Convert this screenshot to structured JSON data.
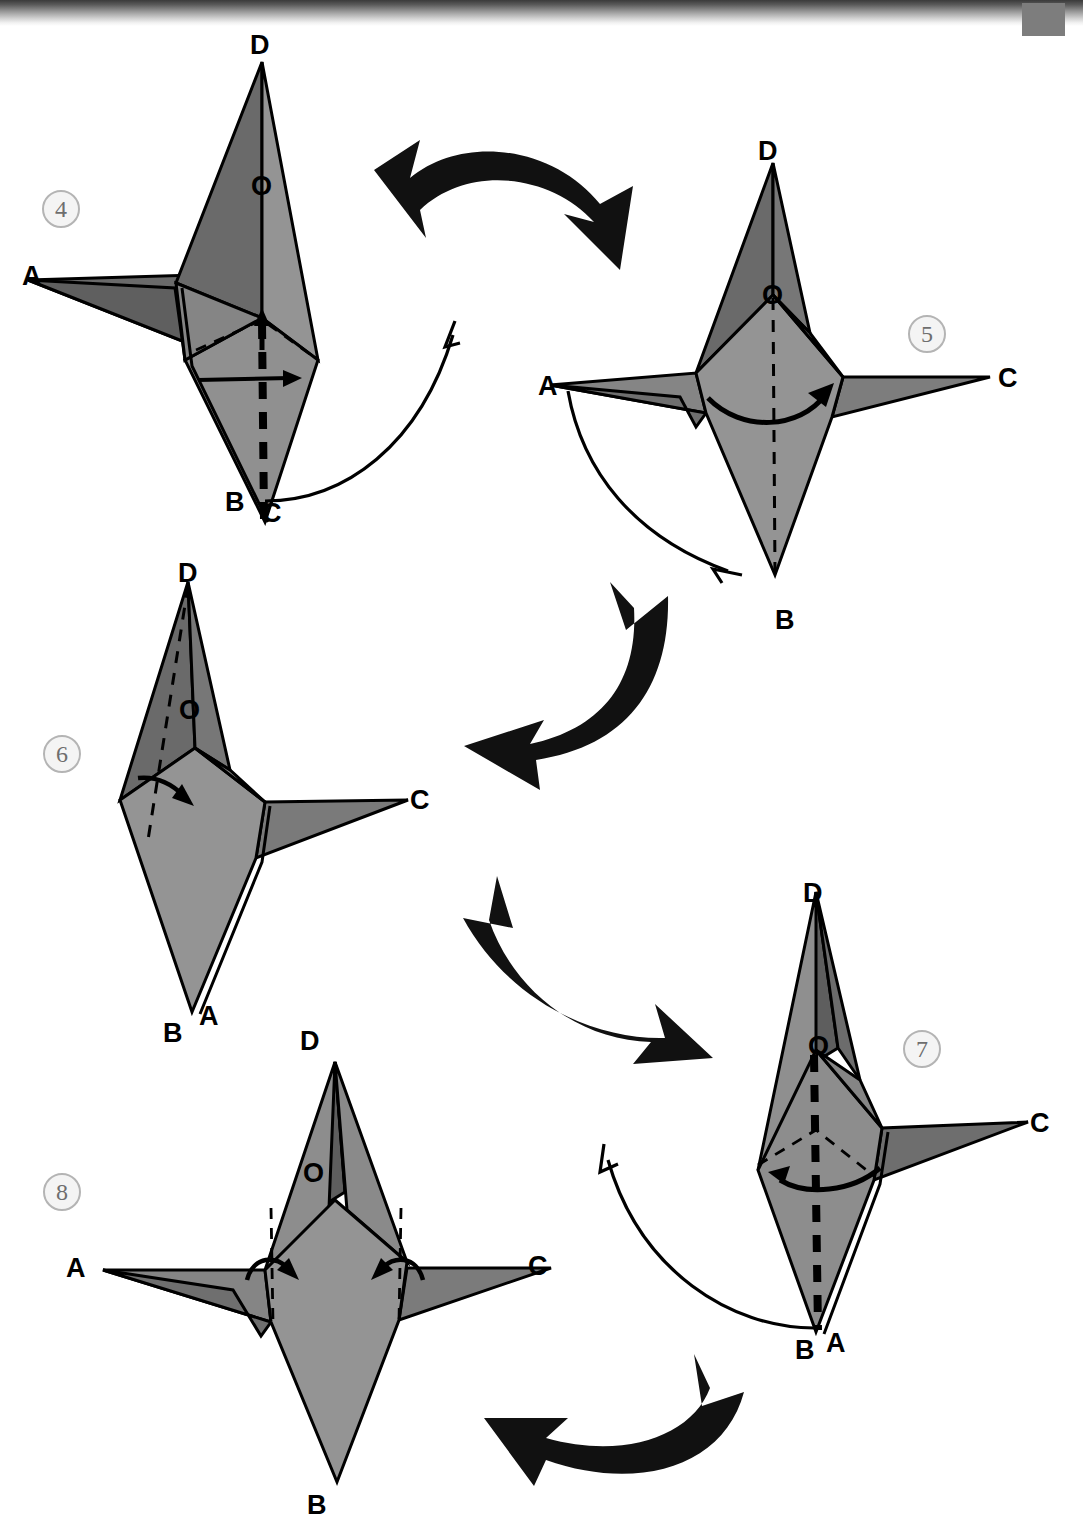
{
  "page": {
    "kind": "origami-instruction-diagram",
    "width": 1083,
    "height": 1538,
    "background_color": "#ffffff",
    "scan_artifacts": {
      "top_shadow_band": true,
      "corner_mark_color": "#7d7d7d"
    }
  },
  "palette": {
    "paper_light": "#949494",
    "paper_dark": "#6a6a6a",
    "paper_mid": "#7e7e7e",
    "outline": "#000000",
    "arrow_black": "#111111",
    "badge_fill": "#f4f4f4",
    "badge_border": "#b4b4b4",
    "badge_text": "#6e6e6e"
  },
  "steps": [
    {
      "number": "4",
      "badge_label": "4",
      "vertex_labels": [
        {
          "text": "D",
          "position": "top"
        },
        {
          "text": "O",
          "position": "center"
        },
        {
          "text": "A",
          "position": "left"
        },
        {
          "text": "B",
          "position": "bottom-left"
        },
        {
          "text": "C",
          "position": "bottom-right"
        }
      ],
      "fold_marks": [
        "thick-dashed-vertical-valley",
        "thin-dashed-creases"
      ],
      "motion_arrows": [
        "short-straight-arrow-right",
        "thin-curved-arrow-up-right-from-C"
      ]
    },
    {
      "number": "5",
      "badge_label": "5",
      "vertex_labels": [
        {
          "text": "D",
          "position": "top"
        },
        {
          "text": "O",
          "position": "center"
        },
        {
          "text": "A",
          "position": "left"
        },
        {
          "text": "C",
          "position": "right"
        },
        {
          "text": "B",
          "position": "bottom"
        }
      ],
      "fold_marks": [
        "thin-dashed-vertical-crease"
      ],
      "motion_arrows": [
        "curved-arrow-right-across-body",
        "thin-curved-arrow-down-right-from-A"
      ]
    },
    {
      "number": "6",
      "badge_label": "6",
      "vertex_labels": [
        {
          "text": "D",
          "position": "top"
        },
        {
          "text": "O",
          "position": "center"
        },
        {
          "text": "C",
          "position": "right"
        },
        {
          "text": "A",
          "position": "bottom-right"
        },
        {
          "text": "B",
          "position": "bottom-left"
        }
      ],
      "fold_marks": [
        "thin-dashed-diagonal-crease"
      ],
      "motion_arrows": [
        "short-hook-arrow-down-right"
      ]
    },
    {
      "number": "7",
      "badge_label": "7",
      "vertex_labels": [
        {
          "text": "D",
          "position": "top"
        },
        {
          "text": "O",
          "position": "center"
        },
        {
          "text": "C",
          "position": "right"
        },
        {
          "text": "B",
          "position": "bottom-left"
        },
        {
          "text": "A",
          "position": "bottom-right"
        }
      ],
      "fold_marks": [
        "thick-dashed-vertical-valley",
        "thin-dashed-creases"
      ],
      "motion_arrows": [
        "curved-arrow-left",
        "thin-curved-arrow-up-left-from-B"
      ]
    },
    {
      "number": "8",
      "badge_label": "8",
      "vertex_labels": [
        {
          "text": "D",
          "position": "top"
        },
        {
          "text": "O",
          "position": "center"
        },
        {
          "text": "A",
          "position": "left"
        },
        {
          "text": "C",
          "position": "right"
        },
        {
          "text": "B",
          "position": "bottom"
        }
      ],
      "fold_marks": [
        "two-thin-dashed-vertical-creases"
      ],
      "motion_arrows": [
        "curved-arrow-inward-left",
        "curved-arrow-inward-right"
      ]
    }
  ],
  "flow_arrows": [
    {
      "name": "arrow-4-to-5",
      "direction": "right-and-down",
      "style": "thick-black-curved"
    },
    {
      "name": "arrow-5-to-6",
      "direction": "down-and-left",
      "style": "thick-black-curved"
    },
    {
      "name": "arrow-6-to-7",
      "direction": "down-and-right",
      "style": "thick-black-curved"
    },
    {
      "name": "arrow-7-to-8",
      "direction": "left",
      "style": "thick-black-curved"
    }
  ]
}
